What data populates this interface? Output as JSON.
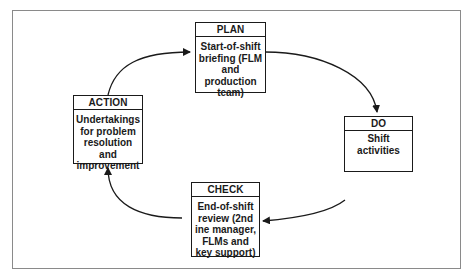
{
  "diagram": {
    "type": "PDCA cycle",
    "steps": {
      "plan": {
        "label": "PLAN",
        "text": "Start-of-shift briefing (FLM and production team)"
      },
      "do": {
        "label": "DO",
        "text": "Shift activities"
      },
      "check": {
        "label": "CHECK",
        "text": "End-of-shift review (2nd ine manager, FLMs and key support)"
      },
      "action": {
        "label": "ACTION",
        "text": "Undertakings for problem resolution and improvement"
      }
    },
    "flow": [
      "PLAN",
      "DO",
      "CHECK",
      "ACTION",
      "PLAN"
    ],
    "colors": {
      "line": "#1a1a1a",
      "frame": "#8a8a8a",
      "background": "#ffffff"
    }
  }
}
